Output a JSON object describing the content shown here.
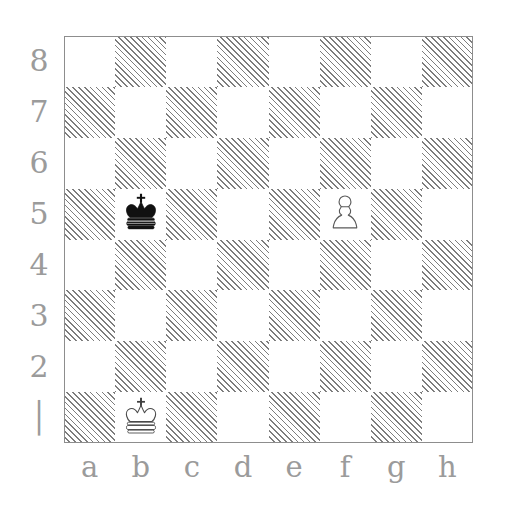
{
  "diagram": {
    "kind": "chess-board-diagram",
    "orientation": "white-bottom",
    "board_size": 8,
    "colors": {
      "light_square": "#ffffff",
      "dark_square_hatch": "#7d7d7d",
      "border": "#8d8d8d",
      "label": "#9b9b9b",
      "black_piece_fill": "#111111",
      "white_piece_fill": "#ffffff",
      "piece_outline": "#4a4a4a"
    },
    "rank_labels": [
      "8",
      "7",
      "6",
      "5",
      "4",
      "3",
      "2",
      "│"
    ],
    "file_labels": [
      "a",
      "b",
      "c",
      "d",
      "e",
      "f",
      "g",
      "h"
    ],
    "squares": [
      [
        "light",
        "dark",
        "light",
        "dark",
        "light",
        "dark",
        "light",
        "dark"
      ],
      [
        "dark",
        "light",
        "dark",
        "light",
        "dark",
        "light",
        "dark",
        "light"
      ],
      [
        "light",
        "dark",
        "light",
        "dark",
        "light",
        "dark",
        "light",
        "dark"
      ],
      [
        "dark",
        "light",
        "dark",
        "light",
        "dark",
        "light",
        "dark",
        "light"
      ],
      [
        "light",
        "dark",
        "light",
        "dark",
        "light",
        "dark",
        "light",
        "dark"
      ],
      [
        "dark",
        "light",
        "dark",
        "light",
        "dark",
        "light",
        "dark",
        "light"
      ],
      [
        "light",
        "dark",
        "light",
        "dark",
        "light",
        "dark",
        "light",
        "dark"
      ],
      [
        "dark",
        "light",
        "dark",
        "light",
        "dark",
        "light",
        "dark",
        "light"
      ]
    ],
    "pieces": [
      {
        "square": "b5",
        "file": "b",
        "rank": "5",
        "color": "black",
        "type": "king",
        "glyph": "♚",
        "name": "black-king"
      },
      {
        "square": "f5",
        "file": "f",
        "rank": "5",
        "color": "white",
        "type": "pawn",
        "glyph": "♙",
        "name": "white-pawn"
      },
      {
        "square": "b1",
        "file": "b",
        "rank": "1",
        "color": "white",
        "type": "king",
        "glyph": "♔",
        "name": "white-king"
      }
    ],
    "fen_placement": "8/8/8/1k3P2/8/8/8/1K6"
  }
}
